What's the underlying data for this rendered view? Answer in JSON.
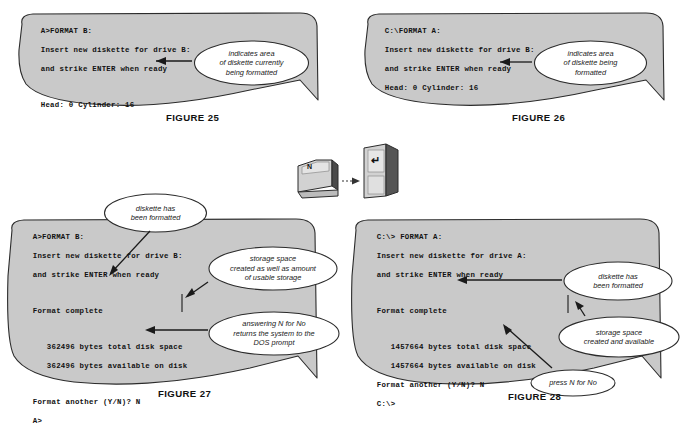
{
  "page": {
    "bg_color": "#ffffff",
    "panel_fill": "#c9c9c9",
    "panel_stroke": "#2b2b2b",
    "balloon_fill": "#ffffff",
    "balloon_stroke": "#2b2b2b"
  },
  "figures": [
    {
      "id": "figure-25",
      "caption": "FIGURE 25",
      "terminal_lines": [
        "A>FORMAT B:",
        "Insert new diskette for drive B:",
        "and strike ENTER when ready",
        "",
        "Head: 0 Cylinder: 16"
      ],
      "callouts": [
        {
          "id": "callout-indicates-area-currently",
          "text": "indicates area\nof diskette currently\nbeing formatted"
        }
      ]
    },
    {
      "id": "figure-26",
      "caption": "FIGURE 26",
      "terminal_lines": [
        "C:\\FORMAT A:",
        "Insert new diskette for drive B:",
        "and strike ENTER when ready",
        "Head: 0 Cylinder: 16"
      ],
      "callouts": [
        {
          "id": "callout-indicates-area-being",
          "text": "indicates area\nof diskette being\nformatted"
        }
      ]
    },
    {
      "id": "figure-27",
      "caption": "FIGURE 27",
      "terminal_lines": [
        "A>FORMAT B:",
        "Insert new diskette for drive B:",
        "and strike ENTER when ready",
        "",
        "Format complete",
        "",
        "   362496 bytes total disk space",
        "   362496 bytes available on disk",
        "",
        "Format another (Y/N)? N",
        "A>"
      ],
      "callouts": [
        {
          "id": "callout-diskette-formatted-27",
          "text": "diskette has\nbeen formatted"
        },
        {
          "id": "callout-storage-space-usable",
          "text": "storage space\ncreated as well as amount\nof usable storage"
        },
        {
          "id": "callout-answering-n-dos-prompt",
          "text": "answering N for No\nreturns the system to the\nDOS prompt"
        }
      ]
    },
    {
      "id": "figure-28",
      "caption": "FIGURE 28",
      "terminal_lines": [
        "C:\\> FORMAT A:",
        "Insert new diskette for drive A:",
        "and strike ENTER when ready",
        "",
        "Format complete",
        "",
        "   1457664 bytes total disk space",
        "   1457664 bytes available on disk",
        "Format another (Y/N)? N",
        "C:\\>"
      ],
      "callouts": [
        {
          "id": "callout-diskette-formatted-28",
          "text": "diskette has\nbeen formatted"
        },
        {
          "id": "callout-storage-created-available",
          "text": "storage space\ncreated and available"
        },
        {
          "id": "callout-press-n-for-no",
          "text": "press N for No"
        }
      ]
    }
  ],
  "keyboard": {
    "n_key_label": "N",
    "enter_key_label": "↵"
  }
}
